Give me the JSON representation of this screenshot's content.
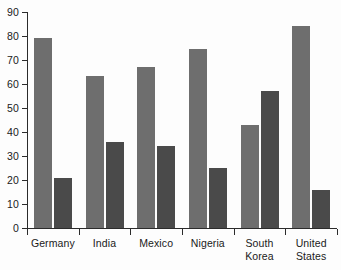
{
  "chart_data": {
    "type": "bar",
    "title": "",
    "subtitle": "",
    "xlabel": "",
    "ylabel": "",
    "grid": false,
    "legend": "none",
    "orientation": "vertical",
    "ylim": [
      0,
      90
    ],
    "yticks": [
      0,
      10,
      20,
      30,
      40,
      50,
      60,
      70,
      80,
      90
    ],
    "ytick_labels": [
      "0",
      "10",
      "20",
      "30",
      "40",
      "50",
      "60",
      "70",
      "80",
      "90"
    ],
    "categories": [
      "Germany",
      "India",
      "Mexico",
      "Nigeria",
      "South\nKorea",
      "United\nStates"
    ],
    "series": [
      {
        "name": "series-1",
        "color": "#6e6e6e",
        "values": [
          79,
          63.5,
          67,
          74.5,
          43,
          84
        ]
      },
      {
        "name": "series-2",
        "color": "#4a4a4a",
        "values": [
          21,
          36,
          34,
          25,
          57,
          16
        ]
      }
    ]
  },
  "axes": {
    "axis_color": "#2b2b2b",
    "background": "#fdfdfd"
  }
}
